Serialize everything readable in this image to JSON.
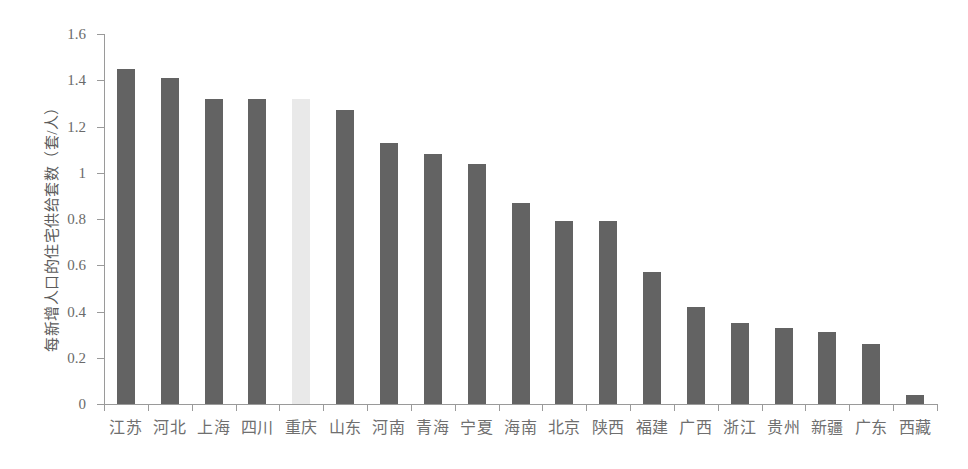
{
  "chart_data": {
    "type": "bar",
    "title": "",
    "xlabel": "",
    "ylabel": "每新增人口的住宅供给套数（套/人）",
    "ylim": [
      0,
      1.6
    ],
    "ytick_labels": [
      "0",
      "0.2",
      "0.4",
      "0.6",
      "0.8",
      "1",
      "1.2",
      "1.4",
      "1.6"
    ],
    "ytick_values": [
      0,
      0.2,
      0.4,
      0.6,
      0.8,
      1,
      1.2,
      1.4,
      1.6
    ],
    "grid": false,
    "legend": null,
    "categories": [
      "江苏",
      "河北",
      "上海",
      "四川",
      "重庆",
      "山东",
      "河南",
      "青海",
      "宁夏",
      "海南",
      "北京",
      "陕西",
      "福建",
      "广西",
      "浙江",
      "贵州",
      "新疆",
      "广东",
      "西藏"
    ],
    "values": [
      1.45,
      1.41,
      1.32,
      1.32,
      1.32,
      1.27,
      1.13,
      1.08,
      1.04,
      0.87,
      0.79,
      0.79,
      0.57,
      0.42,
      0.35,
      0.33,
      0.31,
      0.26,
      0.04
    ],
    "highlight_category": "重庆",
    "highlight_index": 4,
    "colors": {
      "bar": "#636363",
      "bar_highlight": "#e9e9e9",
      "axis": "#9a9a9a",
      "tick_text": "#6a6a6a",
      "label_text": "#6f6f6f",
      "background": "#ffffff"
    }
  }
}
